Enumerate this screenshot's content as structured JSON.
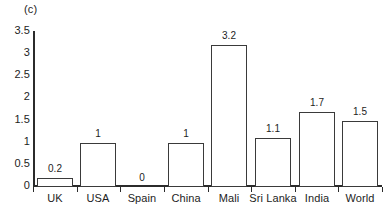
{
  "chart_data": {
    "type": "bar",
    "title": "(c)",
    "xlabel": "",
    "ylabel": "",
    "categories": [
      "UK",
      "USA",
      "Spain",
      "China",
      "Mali",
      "Sri Lanka",
      "India",
      "World"
    ],
    "values": [
      0.2,
      1,
      0,
      1,
      3.2,
      1.1,
      1.7,
      1.5
    ],
    "value_labels": [
      "0.2",
      "1",
      "0",
      "1",
      "3.2",
      "1.1",
      "1.7",
      "1.5"
    ],
    "ylim": [
      0,
      3.5
    ],
    "ytick_labels": [
      "3.5",
      "3",
      "2.5",
      "2",
      "1.5",
      "1",
      "0.5",
      "0"
    ],
    "ytick_values": [
      3.5,
      3,
      2.5,
      2,
      1.5,
      1,
      0.5,
      0
    ],
    "grid": false,
    "legend": "none",
    "bar_fill_color": "#ffffff",
    "bar_edge_color": "#3a3a3a",
    "axis_color": "#2b2b2b",
    "text_color": "#1d1d1d",
    "background_color": "#ffffff"
  }
}
